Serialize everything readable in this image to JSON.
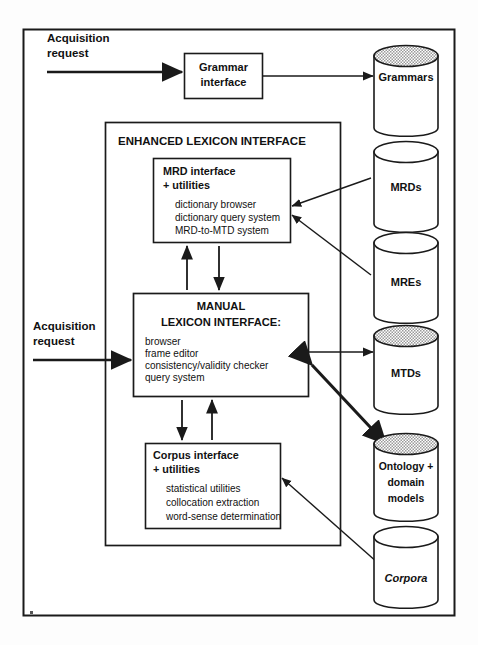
{
  "diagram": {
    "outer_frame": {
      "name": "outer-frame"
    },
    "marker": {
      "symbol": "•"
    },
    "inputs": [
      {
        "id": "acq-top",
        "line1": "Acquisition",
        "line2": "request"
      },
      {
        "id": "acq-middle",
        "line1": "Acquisition",
        "line2": "request"
      }
    ],
    "grammar_box": {
      "line1": "Grammar",
      "line2": "interface"
    },
    "enhanced_box": {
      "title": "ENHANCED LEXICON INTERFACE"
    },
    "mrd_box": {
      "heading1": "MRD interface",
      "heading2": "+ utilities",
      "items": [
        "dictionary browser",
        "dictionary query system",
        "MRD-to-MTD system"
      ]
    },
    "manual_box": {
      "heading1": "MANUAL",
      "heading2": "LEXICON INTERFACE:",
      "items": [
        "browser",
        "frame editor",
        "consistency/validity checker",
        "query system"
      ]
    },
    "corpus_box": {
      "heading1": "Corpus interface",
      "heading2": "+ utilities",
      "items": [
        "statistical utilities",
        "collocation extraction",
        "word-sense determination"
      ]
    },
    "cylinders": [
      {
        "id": "grammars",
        "label": "Grammars",
        "top": "shaded",
        "style": "bold"
      },
      {
        "id": "mrds",
        "label": "MRDs",
        "top": "plain",
        "style": "bold"
      },
      {
        "id": "mres",
        "label": "MREs",
        "top": "plain",
        "style": "bold"
      },
      {
        "id": "mtds",
        "label": "MTDs",
        "top": "shaded",
        "style": "bold"
      },
      {
        "id": "ontology",
        "label_line1": "Ontology +",
        "label_line2": "domain",
        "label_line3": "models",
        "top": "shaded",
        "style": "bold"
      },
      {
        "id": "corpora",
        "label": "Corpora",
        "top": "plain",
        "style": "italic"
      }
    ],
    "colors": {
      "stroke": "#1a1a1a",
      "fill": "#ffffff",
      "background": "#fdfdfd",
      "shade": "#b9b9b9"
    }
  }
}
